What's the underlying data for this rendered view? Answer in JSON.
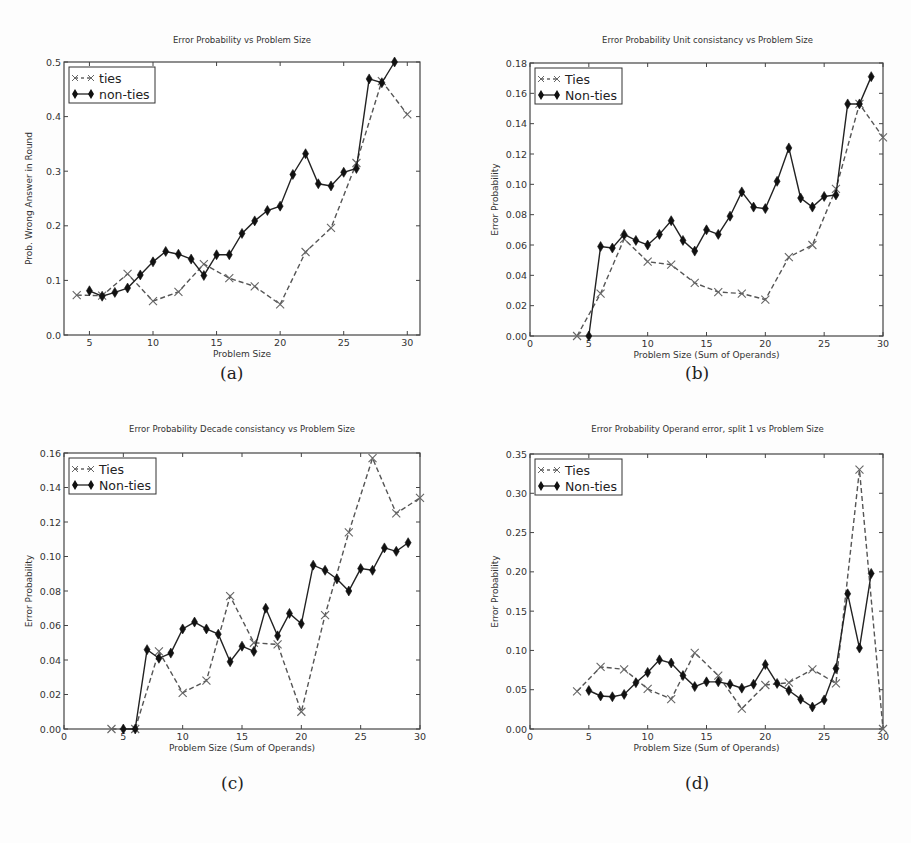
{
  "figure": {
    "captions": [
      "(a)",
      "(b)",
      "(c)",
      "(d)"
    ]
  },
  "chart_data": [
    {
      "type": "line",
      "id": "a",
      "title": "Error Probability vs Problem Size",
      "xlabel": "Problem Size",
      "ylabel": "Prob. Wrong Answer in Round",
      "xlim": [
        3,
        31
      ],
      "ylim": [
        0.0,
        0.5
      ],
      "xticks": [
        5,
        10,
        15,
        20,
        25,
        30
      ],
      "yticks": [
        0.0,
        0.1,
        0.2,
        0.3,
        0.4,
        0.5
      ],
      "ytick_labels": [
        "0.0",
        "0.1",
        "0.2",
        "0.3",
        "0.4",
        "0.5"
      ],
      "grid": false,
      "legend_position": "upper left",
      "series": [
        {
          "name": "ties",
          "style": "dashed",
          "marker": "x",
          "x": [
            4,
            6,
            8,
            10,
            12,
            14,
            16,
            18,
            20,
            22,
            24,
            26,
            28,
            30
          ],
          "values": [
            0.073,
            0.072,
            0.112,
            0.062,
            0.079,
            0.13,
            0.104,
            0.089,
            0.056,
            0.152,
            0.196,
            0.315,
            0.465,
            0.404
          ]
        },
        {
          "name": "non-ties",
          "style": "solid",
          "marker": "diamond",
          "x": [
            5,
            6,
            7,
            8,
            9,
            10,
            11,
            12,
            13,
            14,
            15,
            16,
            17,
            18,
            19,
            20,
            21,
            22,
            23,
            24,
            25,
            26,
            27,
            28,
            29
          ],
          "values": [
            0.081,
            0.071,
            0.078,
            0.086,
            0.11,
            0.134,
            0.153,
            0.148,
            0.139,
            0.109,
            0.147,
            0.147,
            0.186,
            0.209,
            0.228,
            0.236,
            0.294,
            0.332,
            0.277,
            0.273,
            0.298,
            0.305,
            0.469,
            0.462,
            0.5
          ]
        }
      ]
    },
    {
      "type": "line",
      "id": "b",
      "title": "Error Probability Unit consistancy vs Problem Size",
      "xlabel": "Problem Size (Sum of Operands)",
      "ylabel": "Error Probability",
      "xlim": [
        0,
        30
      ],
      "ylim": [
        0.0,
        0.18
      ],
      "xticks": [
        0,
        5,
        10,
        15,
        20,
        25,
        30
      ],
      "yticks": [
        0.0,
        0.02,
        0.04,
        0.06,
        0.08,
        0.1,
        0.12,
        0.14,
        0.16,
        0.18
      ],
      "ytick_labels": [
        "0.00",
        "0.02",
        "0.04",
        "0.06",
        "0.08",
        "0.10",
        "0.12",
        "0.14",
        "0.16",
        "0.18"
      ],
      "grid": false,
      "legend_position": "upper left",
      "series": [
        {
          "name": "Ties",
          "style": "dashed",
          "marker": "x",
          "x": [
            4,
            6,
            8,
            10,
            12,
            14,
            16,
            18,
            20,
            22,
            24,
            26,
            28,
            30
          ],
          "values": [
            0.0,
            0.028,
            0.064,
            0.049,
            0.047,
            0.035,
            0.029,
            0.028,
            0.024,
            0.052,
            0.06,
            0.097,
            0.153,
            0.131
          ]
        },
        {
          "name": "Non-ties",
          "style": "solid",
          "marker": "diamond",
          "x": [
            5,
            6,
            7,
            8,
            9,
            10,
            11,
            12,
            13,
            14,
            15,
            16,
            17,
            18,
            19,
            20,
            21,
            22,
            23,
            24,
            25,
            26,
            27,
            28,
            29
          ],
          "values": [
            0.0,
            0.059,
            0.058,
            0.067,
            0.063,
            0.06,
            0.067,
            0.076,
            0.063,
            0.056,
            0.07,
            0.067,
            0.079,
            0.095,
            0.085,
            0.084,
            0.102,
            0.124,
            0.091,
            0.085,
            0.092,
            0.093,
            0.153,
            0.153,
            0.171
          ]
        }
      ]
    },
    {
      "type": "line",
      "id": "c",
      "title": "Error Probability Decade consistancy vs Problem Size",
      "xlabel": "Problem Size (Sum of Operands)",
      "ylabel": "Error Probability",
      "xlim": [
        0,
        30
      ],
      "ylim": [
        0.0,
        0.16
      ],
      "xticks": [
        0,
        5,
        10,
        15,
        20,
        25,
        30
      ],
      "yticks": [
        0.0,
        0.02,
        0.04,
        0.06,
        0.08,
        0.1,
        0.12,
        0.14,
        0.16
      ],
      "ytick_labels": [
        "0.00",
        "0.02",
        "0.04",
        "0.06",
        "0.08",
        "0.10",
        "0.12",
        "0.14",
        "0.16"
      ],
      "grid": false,
      "legend_position": "upper left",
      "series": [
        {
          "name": "Ties",
          "style": "dashed",
          "marker": "x",
          "x": [
            4,
            6,
            8,
            10,
            12,
            14,
            16,
            18,
            20,
            22,
            24,
            26,
            28,
            30
          ],
          "values": [
            0.0,
            0.0,
            0.045,
            0.021,
            0.028,
            0.077,
            0.05,
            0.049,
            0.01,
            0.066,
            0.114,
            0.157,
            0.125,
            0.134
          ]
        },
        {
          "name": "Non-ties",
          "style": "solid",
          "marker": "diamond",
          "x": [
            5,
            6,
            7,
            8,
            9,
            10,
            11,
            12,
            13,
            14,
            15,
            16,
            17,
            18,
            19,
            20,
            21,
            22,
            23,
            24,
            25,
            26,
            27,
            28,
            29
          ],
          "values": [
            0.0,
            0.0,
            0.046,
            0.041,
            0.044,
            0.058,
            0.062,
            0.058,
            0.055,
            0.039,
            0.048,
            0.045,
            0.07,
            0.054,
            0.067,
            0.061,
            0.095,
            0.092,
            0.087,
            0.08,
            0.093,
            0.092,
            0.105,
            0.103,
            0.108
          ]
        }
      ]
    },
    {
      "type": "line",
      "id": "d",
      "title": "Error Probability Operand error, split 1 vs Problem Size",
      "xlabel": "Problem Size (Sum of Operands)",
      "ylabel": "Error Probability",
      "xlim": [
        0,
        30
      ],
      "ylim": [
        0.0,
        0.35
      ],
      "xticks": [
        0,
        5,
        10,
        15,
        20,
        25,
        30
      ],
      "yticks": [
        0.0,
        0.05,
        0.1,
        0.15,
        0.2,
        0.25,
        0.3,
        0.35
      ],
      "ytick_labels": [
        "0.00",
        "0.05",
        "0.10",
        "0.15",
        "0.20",
        "0.25",
        "0.30",
        "0.35"
      ],
      "grid": false,
      "legend_position": "upper left",
      "series": [
        {
          "name": "Ties",
          "style": "dashed",
          "marker": "x",
          "x": [
            4,
            6,
            8,
            10,
            12,
            14,
            16,
            18,
            20,
            22,
            24,
            26,
            28,
            30
          ],
          "values": [
            0.048,
            0.079,
            0.076,
            0.051,
            0.038,
            0.097,
            0.068,
            0.026,
            0.056,
            0.059,
            0.076,
            0.058,
            0.33,
            0.0
          ]
        },
        {
          "name": "Non-ties",
          "style": "solid",
          "marker": "diamond",
          "x": [
            5,
            6,
            7,
            8,
            9,
            10,
            11,
            12,
            13,
            14,
            15,
            16,
            17,
            18,
            19,
            20,
            21,
            22,
            23,
            24,
            25,
            26,
            27,
            28,
            29
          ],
          "values": [
            0.049,
            0.042,
            0.041,
            0.044,
            0.059,
            0.072,
            0.088,
            0.084,
            0.068,
            0.054,
            0.06,
            0.06,
            0.057,
            0.052,
            0.057,
            0.082,
            0.058,
            0.049,
            0.038,
            0.028,
            0.037,
            0.077,
            0.172,
            0.103,
            0.198
          ]
        }
      ]
    }
  ]
}
